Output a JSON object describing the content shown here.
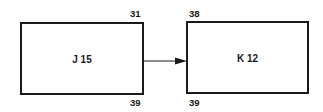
{
  "diagram": {
    "nodes": [
      {
        "id": "J",
        "label": "J 15",
        "top_number": "31",
        "bottom_number": "39"
      },
      {
        "id": "K",
        "label": "K 12",
        "top_number": "38",
        "bottom_number": "39"
      }
    ],
    "edges": [
      {
        "from": "J",
        "to": "K",
        "type": "arrow"
      }
    ]
  }
}
